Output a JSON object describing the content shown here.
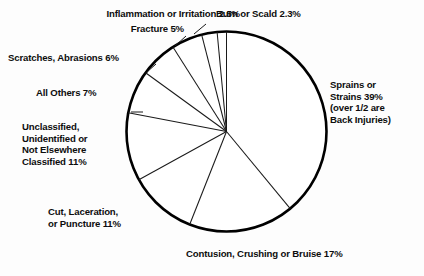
{
  "chart_data": {
    "type": "pie",
    "title": "",
    "subtitle": "",
    "xlabel": "",
    "ylabel": "",
    "legend_position": "none",
    "grid": false,
    "units": "percent",
    "start_angle_deg": 0,
    "direction": "clockwise",
    "categories": [
      "Sprains or Strains",
      "Contusion, Crushing or Bruise",
      "Cut, Laceration, or Puncture",
      "Unclassified, Unidentified or Not Elsewhere Classified",
      "All Others",
      "Scratches, Abrasions",
      "Fracture",
      "Inflammation or Irritation",
      "Burn or Scald"
    ],
    "values": [
      39,
      17,
      11,
      11,
      7,
      6,
      5,
      2.5,
      2.3
    ],
    "slices": [
      {
        "name": "sprains-or-strains",
        "label_lines": [
          "Sprains or",
          "Strains 39%",
          "(over 1/2 are",
          "Back Injuries)"
        ],
        "value": 39,
        "value_text": "39%",
        "angle_deg": 140.4,
        "start_deg": 0,
        "end_deg": 140.4,
        "note": "over 1/2 are Back Injuries"
      },
      {
        "name": "contusion-crushing-bruise",
        "label_lines": [
          "Contusion, Crushing or Bruise 17%"
        ],
        "value": 17,
        "value_text": "17%",
        "angle_deg": 61.2,
        "start_deg": 140.4,
        "end_deg": 201.6,
        "note": ""
      },
      {
        "name": "cut-laceration-puncture",
        "label_lines": [
          "Cut, Laceration,",
          "or Puncture 11%"
        ],
        "value": 11,
        "value_text": "11%",
        "angle_deg": 39.6,
        "start_deg": 201.6,
        "end_deg": 241.2,
        "note": ""
      },
      {
        "name": "unclassified-unidentified",
        "label_lines": [
          "Unclassified,",
          "Unidentified or",
          "Not Elsewhere",
          "Classified 11%"
        ],
        "value": 11,
        "value_text": "11%",
        "angle_deg": 39.6,
        "start_deg": 241.2,
        "end_deg": 280.8,
        "note": ""
      },
      {
        "name": "all-others",
        "label_lines": [
          "All Others 7%"
        ],
        "value": 7,
        "value_text": "7%",
        "angle_deg": 25.2,
        "start_deg": 280.8,
        "end_deg": 306.0,
        "note": ""
      },
      {
        "name": "scratches-abrasions",
        "label_lines": [
          "Scratches, Abrasions 6%"
        ],
        "value": 6,
        "value_text": "6%",
        "angle_deg": 21.6,
        "start_deg": 306.0,
        "end_deg": 327.6,
        "note": ""
      },
      {
        "name": "fracture",
        "label_lines": [
          "Fracture 5%"
        ],
        "value": 5,
        "value_text": "5%",
        "angle_deg": 18.0,
        "start_deg": 327.6,
        "end_deg": 345.6,
        "note": ""
      },
      {
        "name": "inflammation-or-irritation",
        "label_lines": [
          "Inflammation or Irritation 2.5%"
        ],
        "value": 2.5,
        "value_text": "2.5%",
        "angle_deg": 9.0,
        "start_deg": 345.6,
        "end_deg": 354.6,
        "note": ""
      },
      {
        "name": "burn-or-scald",
        "label_lines": [
          "Burn or Scald 2.3%"
        ],
        "value": 2.3,
        "value_text": "2.3%",
        "angle_deg": 8.3,
        "start_deg": 354.6,
        "end_deg": 362.9,
        "note": ""
      }
    ]
  },
  "labels": {
    "inflammation": "Inflammation or Irritation 2.5%",
    "burn": "Burn or Scald 2.3%",
    "fracture": "Fracture 5%",
    "scratches": "Scratches, Abrasions 6%",
    "all_others": "All Others 7%",
    "unclassified": "Unclassified,\nUnidentified or\nNot Elsewhere\nClassified 11%",
    "cut": "Cut, Laceration,\nor Puncture 11%",
    "contusion": "Contusion, Crushing or Bruise 17%",
    "sprains": "Sprains or\nStrains 39%\n(over 1/2 are\nBack Injuries)"
  },
  "style": {
    "background": "#fdfdfd",
    "ink": "#111111",
    "slice_fill": "#ffffff",
    "outline": "#000000"
  }
}
